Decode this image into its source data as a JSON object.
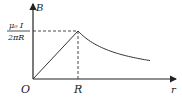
{
  "chart_data": {
    "type": "line",
    "title": "",
    "xlabel": "r",
    "ylabel": "B",
    "origin_label": "O",
    "x_tick_label": "R",
    "y_tick_label_num": "μ₀ I",
    "y_tick_label_den": "2πR",
    "segments": [
      {
        "name": "inside",
        "type": "linear",
        "x": [
          0,
          1
        ],
        "y": [
          0,
          1
        ]
      },
      {
        "name": "outside",
        "type": "inverse",
        "x_range": [
          1,
          2.6
        ],
        "formula": "y = 1/x"
      }
    ],
    "xlim": [
      0,
      3.1
    ],
    "ylim": [
      0,
      1.6
    ],
    "colors": {
      "line": "#333333",
      "axis": "#222222"
    }
  }
}
